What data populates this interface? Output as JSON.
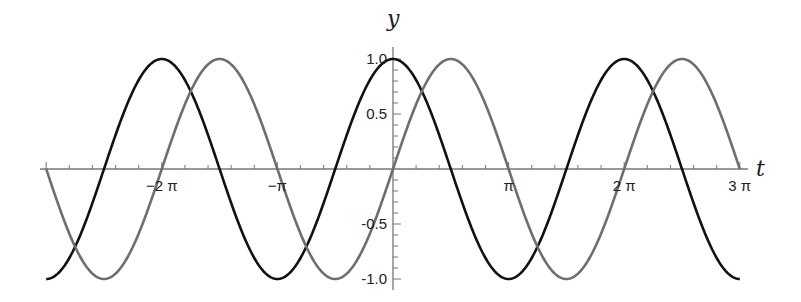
{
  "chart_data": {
    "type": "line",
    "title": "",
    "xlabel": "t",
    "ylabel": "y",
    "xlim": [
      -9.42478,
      9.42478
    ],
    "ylim": [
      -1.0,
      1.0
    ],
    "grid": false,
    "legend": null,
    "x_ticks": [
      {
        "value": -6.28319,
        "label": "−2 π"
      },
      {
        "value": -3.14159,
        "label": "−π"
      },
      {
        "value": 3.14159,
        "label": "π"
      },
      {
        "value": 6.28319,
        "label": "2 π"
      },
      {
        "value": 9.42478,
        "label": "3 π"
      }
    ],
    "y_ticks": [
      {
        "value": 1.0,
        "label": "1.0"
      },
      {
        "value": 0.5,
        "label": "0.5"
      },
      {
        "value": -0.5,
        "label": "-0.5"
      },
      {
        "value": -1.0,
        "label": "-1.0"
      }
    ],
    "series": [
      {
        "name": "cos(t)",
        "function": "cos",
        "color": "#111111",
        "domain": [
          -9.42478,
          9.42478
        ]
      },
      {
        "name": "sin(t)",
        "function": "sin",
        "color": "#6e6e6e",
        "domain": [
          -9.42478,
          9.42478
        ]
      }
    ]
  },
  "layout": {
    "origin_px": [
      393,
      169
    ],
    "pi_px": 115.6,
    "unit_y_px": 110,
    "x_axis_px": [
      40,
      748
    ],
    "y_axis_px": [
      47,
      290
    ]
  }
}
